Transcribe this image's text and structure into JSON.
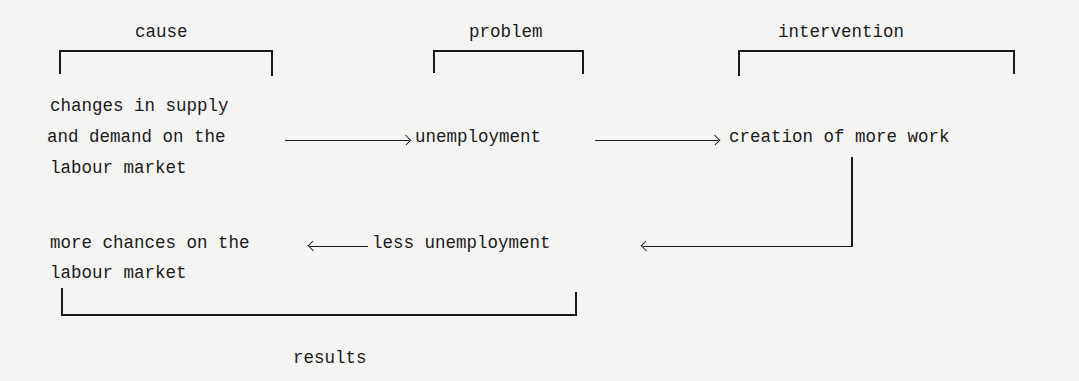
{
  "diagram": {
    "brackets": {
      "cause": "cause",
      "problem": "problem",
      "intervention": "intervention",
      "results": "results"
    },
    "nodes": {
      "cause": {
        "line1": "changes in supply",
        "line2": "and demand on the",
        "line3": "labour market"
      },
      "problem": "unemployment",
      "intervention": "creation of more work",
      "result_1": "less unemployment",
      "result_2": {
        "line1": "more chances on the",
        "line2": "labour market"
      }
    },
    "edges": [
      {
        "from": "cause",
        "to": "problem",
        "direction": "right"
      },
      {
        "from": "problem",
        "to": "intervention",
        "direction": "right"
      },
      {
        "from": "intervention",
        "to": "result_1",
        "direction": "down-left"
      },
      {
        "from": "result_1",
        "to": "result_2",
        "direction": "left"
      }
    ]
  }
}
